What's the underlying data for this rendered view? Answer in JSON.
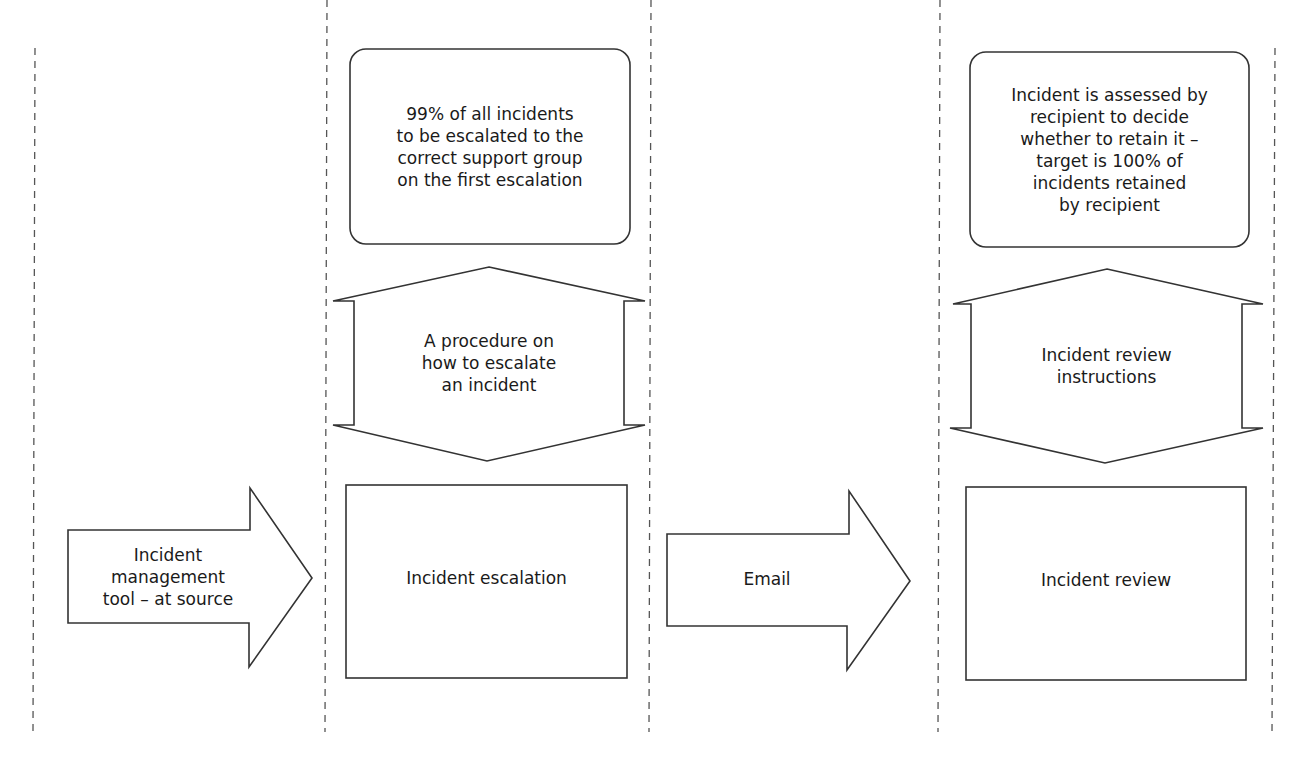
{
  "diagram": {
    "swimlane_dividers": [
      35,
      327,
      651,
      940,
      1272
    ],
    "stroke_color": "#333333",
    "inputs": [
      {
        "id": "input-tool",
        "label": "Incident\nmanagement\ntool – at source"
      },
      {
        "id": "input-email",
        "label": "Email"
      }
    ],
    "processes": [
      {
        "id": "incident-escalation",
        "label": "Incident escalation",
        "control": "A procedure on\nhow to escalate\nan incident",
        "target": "99% of all incidents\nto be escalated to the\ncorrect support group\non the first escalation"
      },
      {
        "id": "incident-review",
        "label": "Incident review",
        "control": "Incident review\ninstructions",
        "target": "Incident is assessed by\nrecipient to decide\nwhether to retain it –\ntarget is 100% of\nincidents retained\nby recipient"
      }
    ]
  }
}
